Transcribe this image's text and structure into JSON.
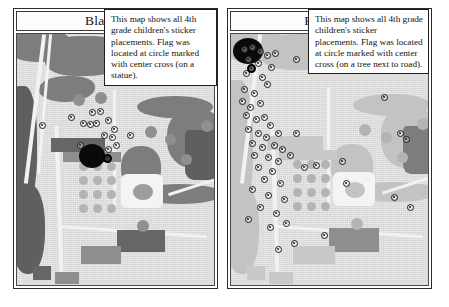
{
  "document": {
    "background_color": "#ffffff",
    "panel_border_color": "#2b2b2b"
  },
  "panels": [
    {
      "id": "black-flag",
      "title": "Black Flag",
      "callout_text": "This map shows all 4th grade children's sticker placements. Flag was located at circle marked with center cross (on a statue).",
      "flag_location_note": "statue",
      "marker_count_visible": 15,
      "markers": [
        {
          "x": 22,
          "y": 88
        },
        {
          "x": 51,
          "y": 80
        },
        {
          "x": 72,
          "y": 75
        },
        {
          "x": 80,
          "y": 74
        },
        {
          "x": 63,
          "y": 86
        },
        {
          "x": 70,
          "y": 87
        },
        {
          "x": 76,
          "y": 86
        },
        {
          "x": 88,
          "y": 83
        },
        {
          "x": 94,
          "y": 92
        },
        {
          "x": 84,
          "y": 98
        },
        {
          "x": 92,
          "y": 100
        },
        {
          "x": 60,
          "y": 108
        },
        {
          "x": 88,
          "y": 112
        },
        {
          "x": 96,
          "y": 108
        },
        {
          "x": 110,
          "y": 98
        }
      ],
      "flag_marker": {
        "x": 86,
        "y": 120
      }
    },
    {
      "id": "red-flag",
      "title": "Red Flag",
      "callout_text": "This map shows all 4th grade children's sticker placements. Flag was located at circle marked with center cross (on a tree next to road).",
      "flag_location_note": "tree next to road",
      "marker_count_visible": 52,
      "markers": [
        {
          "x": 10,
          "y": 12
        },
        {
          "x": 18,
          "y": 10
        },
        {
          "x": 26,
          "y": 14
        },
        {
          "x": 33,
          "y": 18
        },
        {
          "x": 41,
          "y": 16
        },
        {
          "x": 14,
          "y": 22
        },
        {
          "x": 24,
          "y": 26
        },
        {
          "x": 37,
          "y": 30
        },
        {
          "x": 62,
          "y": 22
        },
        {
          "x": 12,
          "y": 36
        },
        {
          "x": 28,
          "y": 40
        },
        {
          "x": 33,
          "y": 47
        },
        {
          "x": 10,
          "y": 52
        },
        {
          "x": 20,
          "y": 56
        },
        {
          "x": 8,
          "y": 64
        },
        {
          "x": 16,
          "y": 70
        },
        {
          "x": 26,
          "y": 66
        },
        {
          "x": 12,
          "y": 78
        },
        {
          "x": 22,
          "y": 82
        },
        {
          "x": 30,
          "y": 80
        },
        {
          "x": 36,
          "y": 88
        },
        {
          "x": 14,
          "y": 92
        },
        {
          "x": 24,
          "y": 96
        },
        {
          "x": 32,
          "y": 100
        },
        {
          "x": 44,
          "y": 96
        },
        {
          "x": 18,
          "y": 106
        },
        {
          "x": 28,
          "y": 110
        },
        {
          "x": 40,
          "y": 108
        },
        {
          "x": 48,
          "y": 112
        },
        {
          "x": 20,
          "y": 118
        },
        {
          "x": 34,
          "y": 120
        },
        {
          "x": 44,
          "y": 124
        },
        {
          "x": 56,
          "y": 118
        },
        {
          "x": 24,
          "y": 130
        },
        {
          "x": 38,
          "y": 134
        },
        {
          "x": 30,
          "y": 142
        },
        {
          "x": 46,
          "y": 146
        },
        {
          "x": 18,
          "y": 152
        },
        {
          "x": 34,
          "y": 158
        },
        {
          "x": 50,
          "y": 162
        },
        {
          "x": 26,
          "y": 170
        },
        {
          "x": 42,
          "y": 176
        },
        {
          "x": 14,
          "y": 182
        },
        {
          "x": 36,
          "y": 190
        },
        {
          "x": 52,
          "y": 186
        },
        {
          "x": 62,
          "y": 96
        },
        {
          "x": 70,
          "y": 130
        },
        {
          "x": 82,
          "y": 128
        },
        {
          "x": 108,
          "y": 124
        },
        {
          "x": 150,
          "y": 60
        },
        {
          "x": 166,
          "y": 96
        },
        {
          "x": 172,
          "y": 102
        },
        {
          "x": 112,
          "y": 146
        },
        {
          "x": 160,
          "y": 160
        },
        {
          "x": 176,
          "y": 170
        },
        {
          "x": 60,
          "y": 206
        },
        {
          "x": 44,
          "y": 212
        },
        {
          "x": 90,
          "y": 198
        }
      ],
      "flag_marker": {
        "x": 16,
        "y": 30
      }
    }
  ]
}
